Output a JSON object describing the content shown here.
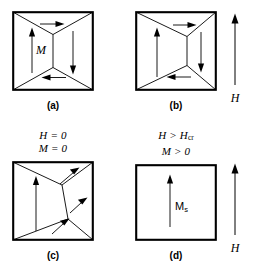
{
  "figure": {
    "type": "magnetic-domain-diagram",
    "panels": [
      {
        "id": "a",
        "caption": "(a)",
        "label": "M",
        "label_kind": "italic",
        "state": "flux-closure domains, symmetric, zero net magnetization",
        "domain_arrows": [
          "up",
          "right",
          "down",
          "left"
        ]
      },
      {
        "id": "b",
        "caption": "(b)",
        "label": "",
        "state": "domain wall displaced right, left up-domain grown",
        "domain_arrows": [
          "up",
          "right",
          "down",
          "left"
        ]
      },
      {
        "id": "c",
        "caption": "(c)",
        "label": "",
        "condition_line1": "H = 0",
        "condition_line2": "M = 0",
        "state": "rotated magnetization, diagonal arrows",
        "domain_arrows": [
          "up",
          "up-right",
          "up-right",
          "up-right"
        ]
      },
      {
        "id": "d",
        "caption": "(d)",
        "label": "M",
        "label_subscript": "s",
        "condition_line1": "H > H",
        "condition_line1_subscript": "cr",
        "condition_line2": "M > 0",
        "state": "single domain, saturation magnetization",
        "domain_arrows": [
          "up"
        ]
      }
    ],
    "field_arrows": [
      {
        "id": "h-top",
        "label": "H",
        "direction": "up"
      },
      {
        "id": "h-bottom",
        "label": "H",
        "direction": "up"
      }
    ],
    "colors": {
      "stroke": "#000000",
      "background": "#ffffff"
    }
  }
}
